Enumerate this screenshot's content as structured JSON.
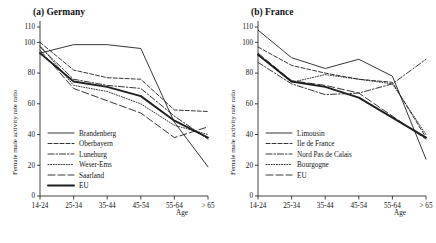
{
  "figure": {
    "y_axis_title": "Female male activity rate ratio",
    "x_axis_title": "Age"
  },
  "chart_data": [
    {
      "type": "line",
      "title": "(a) Germany",
      "panel": "a",
      "xlabel": "Age",
      "ylabel": "Female male activity rate ratio",
      "categories": [
        "14-24",
        "25-34",
        "35-44",
        "45-54",
        "55-64",
        "> 65"
      ],
      "yticks": [
        0,
        20,
        40,
        60,
        80,
        100,
        110
      ],
      "ylim": [
        0,
        110
      ],
      "grid": false,
      "legend_position": "lower-left",
      "series": [
        {
          "name": "Brandenberg",
          "dash": "solid",
          "width": 0.9,
          "values": [
            93,
            98.5,
            98.5,
            96,
            48,
            19
          ]
        },
        {
          "name": "Oberbayern",
          "dash": "dashed",
          "width": 0.9,
          "values": [
            100,
            82,
            77,
            76,
            56,
            55
          ]
        },
        {
          "name": "Luneburg",
          "dash": "dashdot",
          "width": 0.9,
          "values": [
            97,
            76,
            72,
            70,
            52,
            37
          ]
        },
        {
          "name": "Weser-Ems",
          "dash": "dotted",
          "width": 0.9,
          "values": [
            98,
            72,
            68,
            60,
            46,
            40
          ]
        },
        {
          "name": "Saarland",
          "dash": "longdash",
          "width": 0.9,
          "values": [
            95,
            70,
            62,
            54,
            38,
            45
          ]
        },
        {
          "name": "EU",
          "dash": "solid",
          "width": 1.9,
          "values": [
            93,
            74.5,
            71,
            65,
            49,
            38
          ]
        }
      ]
    },
    {
      "type": "line",
      "title": "(b) France",
      "panel": "b",
      "xlabel": "Age",
      "ylabel": "Female male activity rate ratio",
      "categories": [
        "14-24",
        "25-34",
        "35-44",
        "45-54",
        "55-64",
        "> 65"
      ],
      "yticks": [
        0,
        20,
        40,
        60,
        80,
        100,
        110
      ],
      "ylim": [
        0,
        110
      ],
      "grid": false,
      "legend_position": "lower-left",
      "series": [
        {
          "name": "Limousin",
          "dash": "solid",
          "width": 0.9,
          "values": [
            108,
            90,
            83,
            89,
            78,
            24
          ]
        },
        {
          "name": "Ile de France",
          "dash": "dashed",
          "width": 0.9,
          "values": [
            97,
            85,
            80,
            76,
            74,
            38
          ]
        },
        {
          "name": "Nord Pas de Calais",
          "dash": "dashdot",
          "width": 0.9,
          "values": [
            87,
            73,
            66,
            67,
            73,
            89
          ]
        },
        {
          "name": "Bourgogne",
          "dash": "dotted",
          "width": 0.9,
          "values": [
            92,
            74,
            79,
            76,
            73,
            40
          ]
        },
        {
          "name": "EU",
          "dash": "longdash",
          "width": 0.9,
          "values": [
            93,
            75,
            72,
            67,
            52,
            37
          ]
        },
        {
          "name": "EU-bold",
          "dash": "solid",
          "width": 1.9,
          "values": [
            92,
            74.5,
            71,
            64,
            51,
            38
          ]
        }
      ]
    }
  ]
}
